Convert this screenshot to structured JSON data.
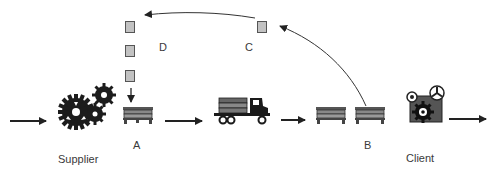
{
  "diagram": {
    "nodes": [
      {
        "id": "supplier",
        "label": "Supplier",
        "icon": "gears-icon"
      },
      {
        "id": "A",
        "label": "A",
        "icon": "pallet-stack-icon"
      },
      {
        "id": "truck",
        "label": "",
        "icon": "truck-icon"
      },
      {
        "id": "B",
        "label": "B",
        "icon": "pallet-stack-icon"
      },
      {
        "id": "client",
        "label": "Client",
        "icon": "machine-gears-icon"
      }
    ],
    "signal_points": [
      {
        "id": "C",
        "label": "C"
      },
      {
        "id": "D",
        "label": "D"
      }
    ],
    "edges": [
      {
        "from": "input",
        "to": "supplier"
      },
      {
        "from": "A",
        "to": "truck"
      },
      {
        "from": "truck",
        "to": "B"
      },
      {
        "from": "client",
        "to": "output"
      },
      {
        "from": "B",
        "to": "C",
        "style": "curved"
      },
      {
        "from": "C",
        "to": "D",
        "style": "curved"
      },
      {
        "from": "D",
        "to": "A"
      }
    ],
    "colors": {
      "line": "#2a2a2a",
      "square_fill": "#c2c2c2",
      "square_border": "#555555",
      "icon_dark": "#1a1a1a",
      "icon_mid": "#6a6a6a"
    }
  }
}
